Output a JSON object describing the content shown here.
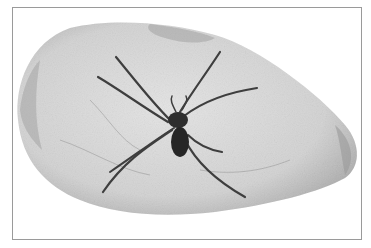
{
  "image": {
    "subject": "spider on stone",
    "style": "monochrome photograph",
    "colors": {
      "background": "#ffffff",
      "frame_border": "#9a9a9a",
      "stone_fill": "#d6d6d6",
      "stone_shadow": "#a8a8a8",
      "spider_body": "#2a2a2a",
      "spider_legs": "#4a4a4a"
    }
  }
}
